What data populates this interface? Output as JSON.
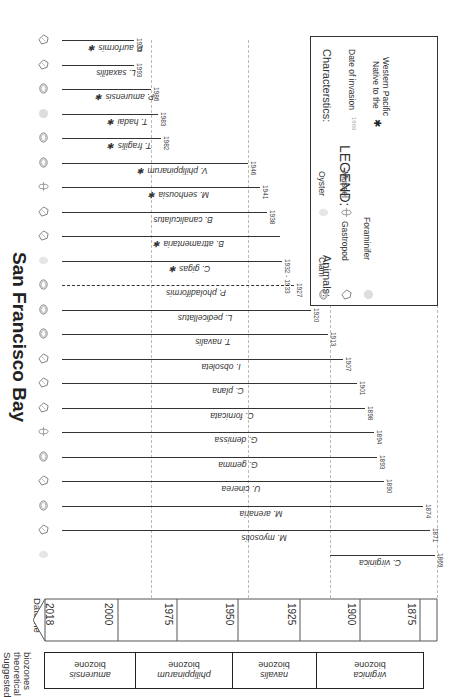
{
  "title": "San Francisco Bay",
  "side_labels": {
    "biozones": [
      "Suggested",
      "theoretical",
      "biozones"
    ],
    "dateline": "Dateline"
  },
  "dateline": {
    "labels": [
      "2018",
      "2000",
      "1975",
      "1950",
      "1925",
      "1900",
      "1875"
    ]
  },
  "biozones": [
    {
      "name": "amurensis",
      "suffix": "biozone"
    },
    {
      "name": "philippinarum",
      "suffix": "biozone"
    },
    {
      "name": "navalis",
      "suffix": "biozone"
    },
    {
      "name": "virginica",
      "suffix": "biozone"
    }
  ],
  "species": [
    {
      "name": "P. aurformis",
      "year": "1993",
      "native_wp": true,
      "animal": "gastropod"
    },
    {
      "name": "L. saxatilis",
      "year": "1993",
      "native_wp": false,
      "animal": "gastropod"
    },
    {
      "name": "P. amurensis",
      "year": "1986",
      "native_wp": true,
      "animal": "clam"
    },
    {
      "name": "T. hadai",
      "year": "1983",
      "native_wp": true,
      "animal": "foraminifer"
    },
    {
      "name": "T. fragilis",
      "year": "1982",
      "native_wp": true,
      "animal": "clam"
    },
    {
      "name": "V. philippinarum",
      "year": "1946",
      "native_wp": true,
      "animal": "clam"
    },
    {
      "name": "M. senhousia",
      "year": "1941",
      "native_wp": true,
      "animal": "mussel"
    },
    {
      "name": "B. canaliculatus",
      "year": "1938",
      "native_wp": false,
      "animal": "gastropod"
    },
    {
      "name": "B. attramentaria",
      "year": "",
      "native_wp": true,
      "animal": "gastropod"
    },
    {
      "name": "C. gigas",
      "year": "1932 - 1933",
      "native_wp": true,
      "animal": "oyster"
    },
    {
      "name": "P. pholadiformis",
      "year": "1927",
      "native_wp": false,
      "animal": "clam",
      "dashed": true
    },
    {
      "name": "L. pedicellatus",
      "year": "1920",
      "native_wp": false,
      "animal": "clam"
    },
    {
      "name": "T. navalis",
      "year": "1913",
      "native_wp": false,
      "animal": "clam"
    },
    {
      "name": "I. obsoleta",
      "year": "1907",
      "native_wp": false,
      "animal": "gastropod"
    },
    {
      "name": "C. plana",
      "year": "1901",
      "native_wp": false,
      "animal": "gastropod"
    },
    {
      "name": "C. fornicata",
      "year": "1898",
      "native_wp": false,
      "animal": "gastropod"
    },
    {
      "name": "G. demissa",
      "year": "1894",
      "native_wp": false,
      "animal": "mussel"
    },
    {
      "name": "G. gemma",
      "year": "1893",
      "native_wp": false,
      "animal": "clam"
    },
    {
      "name": "U. cinerea",
      "year": "1890",
      "native_wp": false,
      "animal": "gastropod"
    },
    {
      "name": "M. arenaria",
      "year": "1874",
      "native_wp": false,
      "animal": "clam"
    },
    {
      "name": "M. myosotis",
      "year": "1871",
      "native_wp": false,
      "animal": "gastropod"
    },
    {
      "name": "C. virginica",
      "year": "1869",
      "native_wp": false,
      "animal": "oyster"
    }
  ],
  "legend": {
    "title": "LEGEND:",
    "animals_header": "Animals:",
    "animals": [
      "Clam",
      "Gastropod",
      "Foraminifer",
      "Oyster",
      "Mussel"
    ],
    "characteristics_header": "Characterstics:",
    "date_sample": "1869",
    "date_label": "Date of invasion",
    "native_label_1": "Native to the",
    "native_label_2": "Western Pacific",
    "star_symbol": "✱"
  },
  "colors": {
    "line": "#333333",
    "grid": "#bbbbbb",
    "border": "#222222"
  }
}
